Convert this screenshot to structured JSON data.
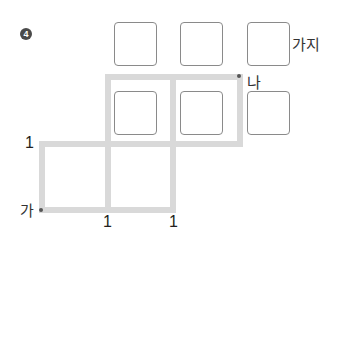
{
  "problem": {
    "number_label": "4",
    "answer_unit": "가지"
  },
  "points": {
    "start": "가",
    "end": "나"
  },
  "counts": {
    "left_top": "1",
    "bottom_middle": "1",
    "bottom_right": "1"
  },
  "answer_boxes": {
    "top_row": [
      "",
      "",
      ""
    ],
    "middle_row": [
      "",
      "",
      ""
    ]
  },
  "colors": {
    "path_line": "#d9d9d9",
    "box_border": "#8a8a8a",
    "dot": "#555555"
  }
}
